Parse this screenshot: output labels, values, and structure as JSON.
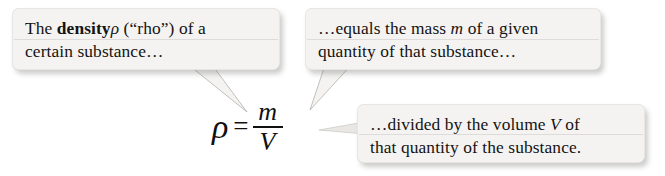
{
  "figure": {
    "kind": "annotated-equation-diagram",
    "background_color": "#ffffff",
    "box_fill_color": "#f4f3f1",
    "text_color": "#141414"
  },
  "callouts": [
    {
      "id": "definition",
      "name": "callout-definition",
      "line1_prefix": "The ",
      "line1_bold": "density",
      "line1_symbol": "ρ",
      "line1_suffix": " (“rho”) of a",
      "line2": "certain substance…",
      "tail_direction": "down-right"
    },
    {
      "id": "mass",
      "name": "callout-mass",
      "line1_prefix": "…equals the mass ",
      "line1_symbol": "m",
      "line1_suffix": " of a given",
      "line2": "quantity of that substance…",
      "tail_direction": "down-left"
    },
    {
      "id": "volume",
      "name": "callout-volume",
      "line1_prefix": "…divided by the volume ",
      "line1_symbol": "V",
      "line1_suffix": " of",
      "line2": "that quantity of the substance.",
      "tail_direction": "left"
    }
  ],
  "equation": {
    "latex": "\\rho = \\frac{m}{V}",
    "plain": "rho = m / V",
    "lhs": "ρ",
    "relation": "=",
    "numerator": "m",
    "denominator": "V"
  }
}
